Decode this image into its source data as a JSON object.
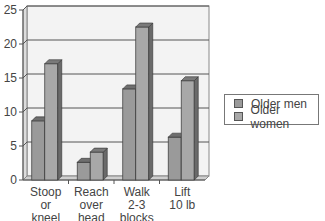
{
  "chart_data": {
    "type": "bar",
    "style": "3d-clustered-column",
    "title": "",
    "xlabel": "",
    "ylabel": "",
    "ylim": [
      0,
      25
    ],
    "yticks": [
      0,
      5,
      10,
      15,
      20,
      25
    ],
    "grid": true,
    "legend_position": "right",
    "categories": [
      "Stoop or kneel",
      "Reach over head",
      "Walk 2-3 blocks",
      "Lift 10 lb"
    ],
    "category_lines": [
      [
        "Stoop",
        "or",
        "kneel"
      ],
      [
        "Reach",
        "over",
        "head"
      ],
      [
        "Walk",
        "2-3",
        "blocks"
      ],
      [
        "Lift",
        "10 lb"
      ]
    ],
    "series": [
      {
        "name": "Older men",
        "values": [
          8.7,
          2.6,
          13.4,
          6.3
        ],
        "color": "#9a9a9a"
      },
      {
        "name": "Older women",
        "values": [
          17.1,
          4.1,
          22.5,
          14.6
        ],
        "color": "#a8a8a8"
      }
    ]
  },
  "legend": {
    "items": [
      {
        "label": "Older men",
        "color": "#9a9a9a"
      },
      {
        "label": "Older women",
        "color": "#a8a8a8"
      }
    ]
  }
}
